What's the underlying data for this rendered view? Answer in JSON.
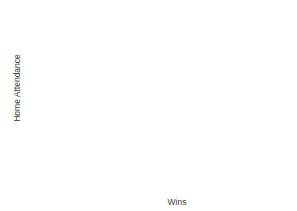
{
  "chart_data": {
    "type": "scatter",
    "title": "",
    "xlabel": "Wins",
    "ylabel": "Home Attendance",
    "xlim": [
      57.5,
      102.5
    ],
    "ylim": [
      5000,
      53000
    ],
    "grid": false,
    "legend": null,
    "marker": {
      "shape": "circle",
      "color": "#8c8c8c",
      "size": 4.2
    },
    "axis_color": "#9a9a9a",
    "text_color": "#4a4a4a",
    "x_ticks_major": [
      65.0,
      75.0,
      85.0,
      95.0
    ],
    "x_tick_labels": [
      "65.0",
      "75.0",
      "85.0",
      "95.0"
    ],
    "x_ticks_minor": [
      60.0,
      70.0,
      80.0,
      90.0,
      100.0
    ],
    "y_ticks_major": [
      22500,
      30000,
      37500,
      45000
    ],
    "y_tick_labels": [
      "22,500",
      "30,000",
      "37,500",
      "45,000"
    ],
    "points": [
      {
        "x": 60.5,
        "y": 7000
      },
      {
        "x": 61.6,
        "y": 6900
      },
      {
        "x": 70.0,
        "y": 24500
      },
      {
        "x": 78.3,
        "y": 28800
      },
      {
        "x": 78.8,
        "y": 22500
      },
      {
        "x": 80.0,
        "y": 27700
      },
      {
        "x": 86.0,
        "y": 33900
      },
      {
        "x": 86.9,
        "y": 26700
      },
      {
        "x": 89.9,
        "y": 40000
      },
      {
        "x": 90.7,
        "y": 34300
      },
      {
        "x": 93.3,
        "y": 22500
      },
      {
        "x": 94.9,
        "y": 30000
      },
      {
        "x": 95.7,
        "y": 26700
      },
      {
        "x": 97.0,
        "y": 51300
      }
    ]
  },
  "axes": {
    "x_title": "Wins",
    "y_title": "Home Attendance"
  }
}
